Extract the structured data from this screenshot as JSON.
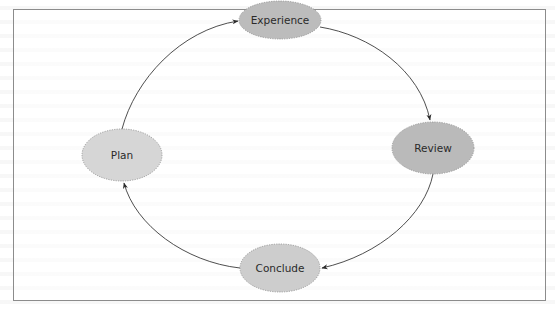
{
  "diagram": {
    "type": "cycle",
    "nodes": [
      {
        "id": "experience",
        "label": "Experience",
        "cx": 280,
        "cy": 20,
        "rx": 41,
        "ry": 19,
        "fill": "#bcbcbc"
      },
      {
        "id": "review",
        "label": "Review",
        "cx": 433,
        "cy": 148,
        "rx": 41,
        "ry": 26,
        "fill": "#bababa"
      },
      {
        "id": "conclude",
        "label": "Conclude",
        "cx": 280,
        "cy": 268,
        "rx": 40,
        "ry": 24,
        "fill": "#cdcdcd"
      },
      {
        "id": "plan",
        "label": "Plan",
        "cx": 122,
        "cy": 155,
        "rx": 40,
        "ry": 26,
        "fill": "#d6d6d6"
      }
    ],
    "edges": [
      {
        "from": "plan",
        "to": "experience"
      },
      {
        "from": "experience",
        "to": "review"
      },
      {
        "from": "review",
        "to": "conclude"
      },
      {
        "from": "conclude",
        "to": "plan"
      }
    ],
    "colors": {
      "frame_border": "#8c8c8c",
      "node_border": "#8a8a8a",
      "edge": "#3a3a3a",
      "text": "#2a2a2a"
    }
  }
}
